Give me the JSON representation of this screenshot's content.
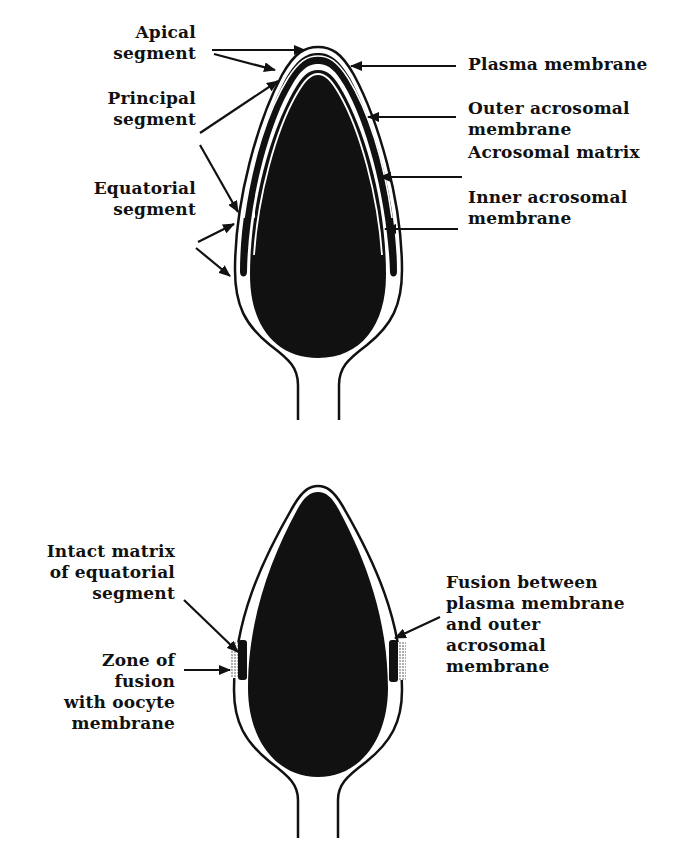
{
  "colors": {
    "ink": "#111111",
    "background": "#ffffff",
    "fusion_stipple": "#9a9a9a"
  },
  "top_diagram": {
    "description": "Intact sperm head acrosome",
    "left_labels": {
      "apical": "Apical\nsegment",
      "principal": "Principal\nsegment",
      "equatorial": "Equatorial\nsegment"
    },
    "right_labels": {
      "plasma": "Plasma membrane",
      "outer": "Outer acrosomal\nmembrane",
      "matrix": "Acrosomal matrix",
      "inner": "Inner acrosomal\nmembrane"
    }
  },
  "bottom_diagram": {
    "description": "Acrosome-reacted sperm head",
    "left_labels": {
      "intact": "Intact matrix\nof equatorial\nsegment",
      "zone": "Zone of\nfusion\nwith oocyte\nmembrane"
    },
    "right_labels": {
      "fusion": "Fusion between\nplasma membrane\nand outer\nacrosomal\nmembrane"
    }
  }
}
